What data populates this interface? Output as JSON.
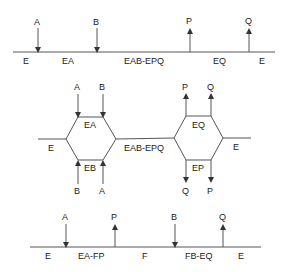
{
  "top_scheme": {
    "name": "ordered-sequential",
    "substrates_in": [
      "A",
      "B"
    ],
    "products_out": [
      "P",
      "Q"
    ],
    "state_labels": [
      "E",
      "EA",
      "EAB-EPQ",
      "EQ",
      "E"
    ]
  },
  "middle_scheme": {
    "name": "random-sequential",
    "left_inputs_top": [
      "A",
      "B"
    ],
    "left_inputs_bottom": [
      "B",
      "A"
    ],
    "left_states": {
      "top": "EA",
      "bottom": "EB"
    },
    "left_enzyme": "E",
    "central_complex": "EAB-EPQ",
    "right_outputs_top": [
      "P",
      "Q"
    ],
    "right_outputs_bottom": [
      "Q",
      "P"
    ],
    "right_states": {
      "top": "EQ",
      "bottom": "EP"
    },
    "right_enzyme": "E"
  },
  "bottom_scheme": {
    "name": "ping-pong",
    "arrows": [
      "A",
      "P",
      "B",
      "Q"
    ],
    "state_labels": [
      "E",
      "EA-FP",
      "F",
      "FB-EQ",
      "E"
    ]
  }
}
